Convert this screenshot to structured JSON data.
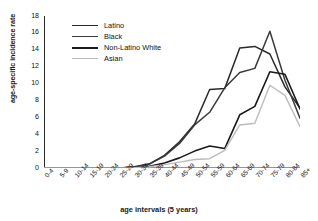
{
  "chart_data": {
    "type": "line",
    "title": "",
    "xlabel": "age intervals (5 years)",
    "ylabel": "age-specific incidence rate",
    "categories": [
      "0-4",
      "5-9",
      "10-14",
      "15-19",
      "20-24",
      "25-29",
      "30-34",
      "35-39",
      "40-44",
      "45-49",
      "50-54",
      "55-59",
      "60-64",
      "65-69",
      "70-74",
      "75-79",
      "80-84",
      "85+"
    ],
    "ylim": [
      0,
      18
    ],
    "yticks": [
      0,
      2,
      4,
      6,
      8,
      10,
      12,
      14,
      16,
      18
    ],
    "grid": false,
    "legend_position": "top-left",
    "series": [
      {
        "name": "Latino",
        "color": "#2b2b2b",
        "width": 1.5,
        "values": [
          0,
          0,
          0,
          0,
          0,
          0,
          0.15,
          0.5,
          1.5,
          3.1,
          5.2,
          9.3,
          9.4,
          14.2,
          14.4,
          13.5,
          9.6,
          7.1
        ]
      },
      {
        "name": "Black",
        "color": "#3a3a3a",
        "width": 1.5,
        "values": [
          0,
          0,
          0,
          0,
          0,
          0,
          0.1,
          0.45,
          1.4,
          2.9,
          5.1,
          6.6,
          9.5,
          11.3,
          11.8,
          16.2,
          10.4,
          5.9
        ]
      },
      {
        "name": "Non-Latino White",
        "color": "#1a1a1a",
        "width": 1.6,
        "values": [
          0,
          0,
          0,
          0,
          0,
          0,
          0.05,
          0.2,
          0.6,
          1.2,
          2.0,
          2.6,
          2.3,
          6.3,
          7.3,
          11.4,
          11.1,
          7.0
        ]
      },
      {
        "name": "Asian",
        "color": "#bcbcbc",
        "width": 1.4,
        "values": [
          0,
          0,
          0,
          0,
          0,
          0,
          0.05,
          0.15,
          0.4,
          0.7,
          1.0,
          1.1,
          2.1,
          5.1,
          5.3,
          9.8,
          8.6,
          4.9
        ]
      }
    ]
  }
}
